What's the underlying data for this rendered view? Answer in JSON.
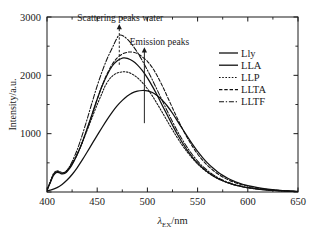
{
  "chart_data": {
    "type": "line",
    "title": "",
    "xlabel": "λEX/nm",
    "xlabel_main": "λ",
    "xlabel_sub": "EX",
    "xlabel_unit": "/nm",
    "ylabel": "Intensity/a.u.",
    "xlim": [
      400,
      650
    ],
    "ylim": [
      0,
      3000
    ],
    "xticks": [
      400,
      450,
      500,
      550,
      600,
      650
    ],
    "xticklabels": [
      "400",
      "450",
      "500",
      "550",
      "600",
      "650"
    ],
    "xminorticks": [
      425,
      475,
      525,
      575,
      625
    ],
    "yticks": [
      0,
      1000,
      2000,
      3000
    ],
    "yticklabels": [
      "",
      "1000",
      "2000",
      "3000"
    ],
    "yminorticks": [
      500,
      1500,
      2500
    ],
    "grid": false,
    "legend_position": "upper-right",
    "series": [
      {
        "name": "Lly",
        "style": "solid",
        "color": "#111111",
        "peak_x": 497,
        "peak_y": 1740,
        "points": [
          [
            400,
            20
          ],
          [
            405,
            40
          ],
          [
            410,
            75
          ],
          [
            415,
            130
          ],
          [
            420,
            205
          ],
          [
            425,
            300
          ],
          [
            430,
            415
          ],
          [
            435,
            545
          ],
          [
            440,
            685
          ],
          [
            445,
            830
          ],
          [
            450,
            970
          ],
          [
            455,
            1110
          ],
          [
            460,
            1245
          ],
          [
            465,
            1370
          ],
          [
            470,
            1480
          ],
          [
            475,
            1570
          ],
          [
            480,
            1645
          ],
          [
            485,
            1700
          ],
          [
            490,
            1730
          ],
          [
            495,
            1740
          ],
          [
            500,
            1735
          ],
          [
            505,
            1705
          ],
          [
            510,
            1650
          ],
          [
            515,
            1570
          ],
          [
            520,
            1470
          ],
          [
            525,
            1350
          ],
          [
            530,
            1215
          ],
          [
            535,
            1080
          ],
          [
            540,
            945
          ],
          [
            545,
            815
          ],
          [
            550,
            695
          ],
          [
            555,
            590
          ],
          [
            560,
            495
          ],
          [
            565,
            415
          ],
          [
            570,
            345
          ],
          [
            575,
            285
          ],
          [
            580,
            235
          ],
          [
            585,
            195
          ],
          [
            590,
            160
          ],
          [
            595,
            132
          ],
          [
            600,
            108
          ],
          [
            610,
            74
          ],
          [
            620,
            50
          ],
          [
            630,
            33
          ],
          [
            640,
            20
          ],
          [
            650,
            10
          ]
        ]
      },
      {
        "name": "LLA",
        "style": "solid",
        "color": "#111111",
        "peak_x": 477,
        "peak_y": 2300,
        "points": [
          [
            400,
            30
          ],
          [
            403,
            150
          ],
          [
            406,
            270
          ],
          [
            409,
            330
          ],
          [
            412,
            330
          ],
          [
            415,
            310
          ],
          [
            418,
            320
          ],
          [
            421,
            370
          ],
          [
            425,
            470
          ],
          [
            430,
            640
          ],
          [
            435,
            850
          ],
          [
            440,
            1090
          ],
          [
            445,
            1340
          ],
          [
            450,
            1590
          ],
          [
            455,
            1820
          ],
          [
            460,
            2010
          ],
          [
            465,
            2160
          ],
          [
            470,
            2250
          ],
          [
            475,
            2295
          ],
          [
            477,
            2300
          ],
          [
            480,
            2290
          ],
          [
            485,
            2250
          ],
          [
            490,
            2180
          ],
          [
            495,
            2080
          ],
          [
            500,
            1955
          ],
          [
            505,
            1810
          ],
          [
            510,
            1650
          ],
          [
            515,
            1480
          ],
          [
            520,
            1310
          ],
          [
            525,
            1145
          ],
          [
            530,
            985
          ],
          [
            535,
            840
          ],
          [
            540,
            710
          ],
          [
            545,
            595
          ],
          [
            550,
            495
          ],
          [
            555,
            412
          ],
          [
            560,
            342
          ],
          [
            565,
            283
          ],
          [
            570,
            234
          ],
          [
            575,
            193
          ],
          [
            580,
            159
          ],
          [
            585,
            131
          ],
          [
            590,
            108
          ],
          [
            595,
            89
          ],
          [
            600,
            73
          ],
          [
            610,
            50
          ],
          [
            620,
            34
          ],
          [
            630,
            22
          ],
          [
            640,
            14
          ],
          [
            650,
            8
          ]
        ]
      },
      {
        "name": "LLP",
        "style": "dotted",
        "color": "#111111",
        "peak_x": 475,
        "peak_y": 2060,
        "points": [
          [
            400,
            30
          ],
          [
            403,
            170
          ],
          [
            406,
            300
          ],
          [
            409,
            360
          ],
          [
            412,
            355
          ],
          [
            415,
            335
          ],
          [
            418,
            345
          ],
          [
            421,
            395
          ],
          [
            425,
            490
          ],
          [
            430,
            650
          ],
          [
            435,
            840
          ],
          [
            440,
            1060
          ],
          [
            445,
            1280
          ],
          [
            450,
            1500
          ],
          [
            455,
            1700
          ],
          [
            458,
            1820
          ],
          [
            462,
            1930
          ],
          [
            466,
            2000
          ],
          [
            470,
            2040
          ],
          [
            475,
            2060
          ],
          [
            480,
            2055
          ],
          [
            485,
            2020
          ],
          [
            490,
            1960
          ],
          [
            495,
            1875
          ],
          [
            500,
            1770
          ],
          [
            505,
            1645
          ],
          [
            510,
            1505
          ],
          [
            515,
            1360
          ],
          [
            520,
            1210
          ],
          [
            525,
            1065
          ],
          [
            530,
            925
          ],
          [
            535,
            795
          ],
          [
            540,
            678
          ],
          [
            545,
            573
          ],
          [
            550,
            481
          ],
          [
            555,
            402
          ],
          [
            560,
            335
          ],
          [
            565,
            279
          ],
          [
            570,
            231
          ],
          [
            575,
            191
          ],
          [
            580,
            158
          ],
          [
            585,
            130
          ],
          [
            590,
            107
          ],
          [
            595,
            88
          ],
          [
            600,
            72
          ],
          [
            610,
            49
          ],
          [
            620,
            33
          ],
          [
            630,
            21
          ],
          [
            640,
            13
          ],
          [
            650,
            7
          ]
        ]
      },
      {
        "name": "LLTA",
        "style": "dashed",
        "color": "#111111",
        "peak_x": 483,
        "peak_y": 2400,
        "points": [
          [
            400,
            30
          ],
          [
            403,
            160
          ],
          [
            406,
            285
          ],
          [
            409,
            345
          ],
          [
            412,
            345
          ],
          [
            415,
            325
          ],
          [
            418,
            335
          ],
          [
            421,
            385
          ],
          [
            425,
            480
          ],
          [
            430,
            640
          ],
          [
            435,
            845
          ],
          [
            440,
            1080
          ],
          [
            445,
            1330
          ],
          [
            450,
            1590
          ],
          [
            455,
            1830
          ],
          [
            460,
            2030
          ],
          [
            465,
            2190
          ],
          [
            470,
            2300
          ],
          [
            475,
            2365
          ],
          [
            480,
            2395
          ],
          [
            483,
            2400
          ],
          [
            487,
            2392
          ],
          [
            491,
            2365
          ],
          [
            495,
            2315
          ],
          [
            500,
            2240
          ],
          [
            505,
            2130
          ],
          [
            510,
            1985
          ],
          [
            515,
            1815
          ],
          [
            520,
            1630
          ],
          [
            525,
            1440
          ],
          [
            530,
            1255
          ],
          [
            535,
            1080
          ],
          [
            540,
            920
          ],
          [
            545,
            778
          ],
          [
            550,
            652
          ],
          [
            555,
            545
          ],
          [
            560,
            454
          ],
          [
            565,
            377
          ],
          [
            570,
            312
          ],
          [
            575,
            258
          ],
          [
            580,
            213
          ],
          [
            585,
            176
          ],
          [
            590,
            145
          ],
          [
            595,
            119
          ],
          [
            600,
            98
          ],
          [
            610,
            66
          ],
          [
            620,
            44
          ],
          [
            630,
            29
          ],
          [
            640,
            18
          ],
          [
            650,
            10
          ]
        ]
      },
      {
        "name": "LLTF",
        "style": "dashdot",
        "color": "#111111",
        "peak_x": 472,
        "peak_y": 2690,
        "points": [
          [
            400,
            30
          ],
          [
            403,
            155
          ],
          [
            406,
            280
          ],
          [
            409,
            340
          ],
          [
            412,
            340
          ],
          [
            415,
            320
          ],
          [
            418,
            335
          ],
          [
            421,
            395
          ],
          [
            425,
            520
          ],
          [
            430,
            720
          ],
          [
            435,
            970
          ],
          [
            440,
            1250
          ],
          [
            445,
            1540
          ],
          [
            450,
            1820
          ],
          [
            455,
            2070
          ],
          [
            460,
            2290
          ],
          [
            465,
            2470
          ],
          [
            468,
            2580
          ],
          [
            471,
            2675
          ],
          [
            473,
            2690
          ],
          [
            476,
            2675
          ],
          [
            480,
            2620
          ],
          [
            485,
            2520
          ],
          [
            490,
            2395
          ],
          [
            495,
            2250
          ],
          [
            500,
            2090
          ],
          [
            505,
            1920
          ],
          [
            510,
            1740
          ],
          [
            515,
            1560
          ],
          [
            520,
            1380
          ],
          [
            525,
            1205
          ],
          [
            530,
            1040
          ],
          [
            535,
            890
          ],
          [
            540,
            755
          ],
          [
            545,
            635
          ],
          [
            550,
            530
          ],
          [
            555,
            440
          ],
          [
            560,
            365
          ],
          [
            565,
            302
          ],
          [
            570,
            249
          ],
          [
            575,
            205
          ],
          [
            580,
            169
          ],
          [
            585,
            139
          ],
          [
            590,
            114
          ],
          [
            595,
            94
          ],
          [
            600,
            77
          ],
          [
            610,
            52
          ],
          [
            620,
            35
          ],
          [
            630,
            22
          ],
          [
            640,
            14
          ],
          [
            650,
            8
          ]
        ]
      }
    ],
    "annotations": [
      {
        "text": "Scattering peaks water",
        "text_x": 473,
        "text_y": 2980,
        "arrow_style": "dashed",
        "arrow_x": 472,
        "arrow_from_y": 2180,
        "arrow_to_y": 2880
      },
      {
        "text": "Emission peaks",
        "text_x": 512,
        "text_y": 2580,
        "arrow_style": "solid",
        "arrow_x": 497,
        "arrow_from_y": 1180,
        "arrow_to_y": 2480
      }
    ]
  },
  "legend": {
    "items": [
      {
        "label": "Lly",
        "style": "solid"
      },
      {
        "label": "LLA",
        "style": "solid"
      },
      {
        "label": "LLP",
        "style": "dotted"
      },
      {
        "label": "LLTA",
        "style": "dashed"
      },
      {
        "label": "LLTF",
        "style": "dashdot"
      }
    ]
  }
}
